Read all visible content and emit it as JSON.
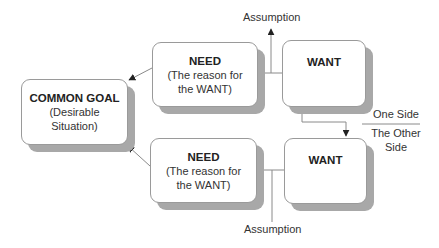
{
  "diagram": {
    "type": "conflict-resolution-diagram",
    "common_goal": {
      "title": "COMMON GOAL",
      "line1": "(Desirable",
      "line2": "Situation)"
    },
    "need_top": {
      "title": "NEED",
      "line1": "(The reason for",
      "line2": "the WANT)"
    },
    "need_bottom": {
      "title": "NEED",
      "line1": "(The reason for",
      "line2": "the WANT)"
    },
    "want_top": {
      "title": "WANT"
    },
    "want_bottom": {
      "title": "WANT"
    },
    "assumption_top": "Assumption",
    "assumption_bottom": "Assumption",
    "side_labels": {
      "one_side": "One Side",
      "other_side_line1": "The Other",
      "other_side_line2": "Side"
    },
    "colors": {
      "border": "#9a9a9a",
      "shadow": "#a8a8a8",
      "line": "#8a8a8a",
      "arrow": "#222222"
    }
  }
}
